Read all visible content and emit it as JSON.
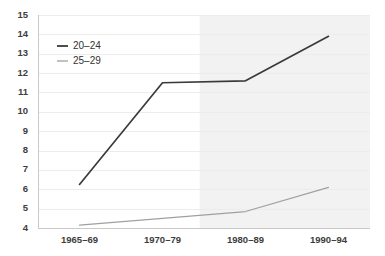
{
  "chart_data": {
    "type": "line",
    "title": "",
    "subtitle": "",
    "xlabel": "",
    "ylabel": "",
    "categories": [
      "1965–69",
      "1970–79",
      "1980–89",
      "1990–94"
    ],
    "series": [
      {
        "name": "20–24",
        "color": "#3a3a3a",
        "values": [
          6.25,
          11.5,
          11.6,
          13.9
        ]
      },
      {
        "name": "25–29",
        "color": "#a0a0a0",
        "values": [
          4.15,
          4.5,
          4.85,
          6.1
        ]
      }
    ],
    "ylim": [
      4,
      15
    ],
    "yticks": [
      4,
      5,
      6,
      7,
      8,
      9,
      10,
      11,
      12,
      13,
      14,
      15
    ],
    "ytick_labels": [
      "4",
      "5",
      "6",
      "7",
      "8",
      "9",
      "10",
      "11",
      "12",
      "13",
      "14",
      "15"
    ],
    "grid": true,
    "grid_axis": "y",
    "grid_color": "#ececed",
    "legend_position": "upper left",
    "background_color": "#ffffff",
    "shaded_region": {
      "label": "",
      "x_start_fraction": 0.487,
      "x_end_fraction": 1.0,
      "color": "#f2f2f2"
    },
    "annotations": []
  },
  "axes": {
    "y_axis_name": "y-axis",
    "x_axis_name": "x-axis"
  },
  "legend": {
    "entries": [
      {
        "label": "20–24",
        "color": "#3a3a3a"
      },
      {
        "label": "25–29",
        "color": "#a0a0a0"
      }
    ]
  }
}
